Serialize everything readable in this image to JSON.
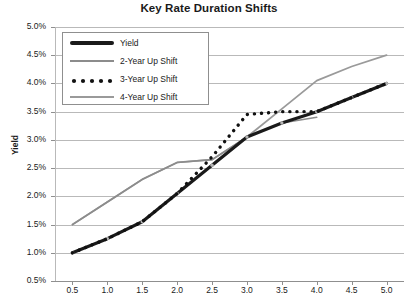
{
  "chart_data": {
    "type": "line",
    "title": "Key Rate Duration Shifts",
    "xlabel": "",
    "ylabel": "Yield",
    "xlim": [
      0.25,
      5.25
    ],
    "ylim": [
      0.5,
      5.0
    ],
    "grid": true,
    "legend_position": "top-left-inside",
    "x_ticks": [
      "0.5",
      "1.0",
      "1.5",
      "2.0",
      "2.5",
      "3.0",
      "3.5",
      "4.0",
      "4.5",
      "5.0"
    ],
    "x_tick_values": [
      0.5,
      1.0,
      1.5,
      2.0,
      2.5,
      3.0,
      3.5,
      4.0,
      4.5,
      5.0
    ],
    "y_ticks": [
      "0.5%",
      "1.0%",
      "1.5%",
      "2.0%",
      "2.5%",
      "3.0%",
      "3.5%",
      "4.0%",
      "4.5%",
      "5.0%"
    ],
    "y_tick_values": [
      0.5,
      1.0,
      1.5,
      2.0,
      2.5,
      3.0,
      3.5,
      4.0,
      4.5,
      5.0
    ],
    "x": [
      0.5,
      1.0,
      1.5,
      2.0,
      2.5,
      3.0,
      3.5,
      4.0,
      4.5,
      5.0
    ],
    "series": [
      {
        "name": "Yield",
        "style": "solid-thick",
        "color": "#1a1a1a",
        "width": 3.2,
        "values": [
          1.0,
          1.25,
          1.55,
          2.05,
          2.55,
          3.05,
          3.3,
          3.5,
          3.75,
          4.0
        ]
      },
      {
        "name": "2-Year Up Shift",
        "style": "solid-thin",
        "color": "#8c8c8c",
        "width": 1.6,
        "x": [
          0.5,
          1.0,
          1.5,
          2.0,
          2.5,
          3.0,
          3.5,
          4.0
        ],
        "values": [
          1.5,
          1.9,
          2.3,
          2.6,
          2.65,
          3.05,
          3.3,
          3.4
        ]
      },
      {
        "name": "3-Year Up Shift",
        "style": "dotted",
        "color": "#111111",
        "width": 3.4,
        "values": [
          1.0,
          1.25,
          1.55,
          2.05,
          2.7,
          3.45,
          3.5,
          3.5,
          3.75,
          4.0
        ]
      },
      {
        "name": "4-Year Up Shift",
        "style": "solid-thin",
        "color": "#9a9a9a",
        "width": 1.8,
        "values": [
          1.5,
          1.9,
          2.3,
          2.6,
          2.65,
          3.05,
          3.55,
          4.05,
          4.3,
          4.5
        ]
      }
    ]
  },
  "legend": {
    "items": [
      {
        "label": "Yield",
        "swatch": "thick-black-line"
      },
      {
        "label": "2-Year Up Shift",
        "swatch": "thin-gray-line"
      },
      {
        "label": "3-Year Up Shift",
        "swatch": "black-dots"
      },
      {
        "label": "4-Year Up Shift",
        "swatch": "thin-gray-line"
      }
    ]
  },
  "colors": {
    "yield": "#1a1a1a",
    "shift_gray": "#8c8c8c",
    "grid": "#b9b9b9",
    "axis": "#8f8f8f",
    "text": "#1a1a1a",
    "background": "#ffffff"
  }
}
